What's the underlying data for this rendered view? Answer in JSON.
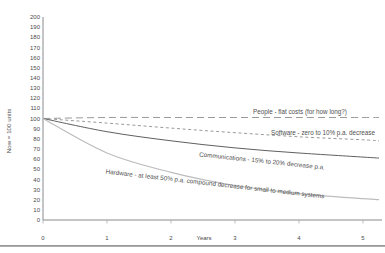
{
  "figure": {
    "background": "#ffffff",
    "divider_color": "#9a9a9a",
    "axis_color": "#8a8a8a",
    "tick_color": "#aaaaaa",
    "text_color": "#4a4a4a"
  },
  "chart_data": {
    "type": "line",
    "title": "",
    "xlabel": "Years",
    "ylabel": "Now = 100 units",
    "xlim": [
      0,
      5.25
    ],
    "ylim": [
      0,
      200
    ],
    "x_ticks": [
      0,
      1,
      2,
      3,
      4,
      5
    ],
    "y_ticks": [
      0,
      10,
      20,
      30,
      40,
      50,
      60,
      70,
      80,
      90,
      100,
      110,
      120,
      130,
      140,
      150,
      160,
      170,
      180,
      190,
      200
    ],
    "grid": false,
    "legend_position": "inline labels along lines",
    "x": [
      0,
      1,
      2,
      3,
      4,
      5,
      5.25
    ],
    "series": [
      {
        "name": "People",
        "label": "People - flat costs (for how long?)",
        "values": [
          100,
          101,
          101,
          101,
          101,
          101,
          101
        ],
        "color": "#9a9a9a",
        "dash": "7 4",
        "width": 1
      },
      {
        "name": "Software",
        "label": "Software - zero to 10% p.a. decrease",
        "values": [
          100,
          95.5,
          90.5,
          86,
          82,
          79,
          78
        ],
        "color": "#9a9a9a",
        "dash": "3 2.6",
        "width": 1
      },
      {
        "name": "Communications",
        "label": "Communications - 15% to 20% decrease p.a.",
        "values": [
          100,
          87,
          78,
          71,
          66,
          62,
          61
        ],
        "color": "#606060",
        "dash": "",
        "width": 1
      },
      {
        "name": "Hardware",
        "label": "Hardware - at least 50% p.a. compound decrease for small to medium systems",
        "values": [
          100,
          66,
          47,
          34,
          26,
          21,
          20
        ],
        "color": "#bdbdbd",
        "dash": "",
        "width": 1.2
      }
    ]
  }
}
